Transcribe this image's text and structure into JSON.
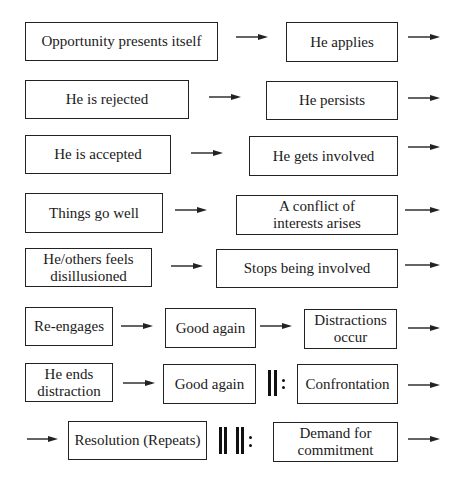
{
  "diagram": {
    "title": "",
    "nodes": [
      {
        "id": "n1",
        "label": "Opportunity presents itself",
        "x": 25,
        "y": 22,
        "w": 193,
        "h": 39
      },
      {
        "id": "n2",
        "label": "He applies",
        "x": 286,
        "y": 22,
        "w": 112,
        "h": 40
      },
      {
        "id": "n3",
        "label": "He is rejected",
        "x": 25,
        "y": 80,
        "w": 164,
        "h": 39
      },
      {
        "id": "n4",
        "label": "He persists",
        "x": 266,
        "y": 81,
        "w": 132,
        "h": 39
      },
      {
        "id": "n5",
        "label": "He is accepted",
        "x": 25,
        "y": 135,
        "w": 146,
        "h": 39
      },
      {
        "id": "n6",
        "label": "He gets involved",
        "x": 249,
        "y": 136,
        "w": 149,
        "h": 40
      },
      {
        "id": "n7",
        "label": "Things go well",
        "x": 25,
        "y": 193,
        "w": 138,
        "h": 40
      },
      {
        "id": "n8",
        "label": "A conflict of\ninterests arises",
        "x": 236,
        "y": 195,
        "w": 162,
        "h": 40
      },
      {
        "id": "n9",
        "label": "He/others feels\ndisillusioned",
        "x": 25,
        "y": 248,
        "w": 127,
        "h": 39
      },
      {
        "id": "n10",
        "label": "Stops being involved",
        "x": 216,
        "y": 249,
        "w": 182,
        "h": 39
      },
      {
        "id": "n11",
        "label": "Re-engages",
        "x": 25,
        "y": 307,
        "w": 88,
        "h": 39
      },
      {
        "id": "n12",
        "label": "Good again",
        "x": 165,
        "y": 308,
        "w": 91,
        "h": 40
      },
      {
        "id": "n13",
        "label": "Distractions\noccur",
        "x": 304,
        "y": 309,
        "w": 93,
        "h": 40
      },
      {
        "id": "n14",
        "label": "He ends\ndistraction",
        "x": 25,
        "y": 363,
        "w": 88,
        "h": 39
      },
      {
        "id": "n15",
        "label": "Good again",
        "x": 163,
        "y": 364,
        "w": 93,
        "h": 40
      },
      {
        "id": "n16",
        "label": "Confrontation",
        "x": 297,
        "y": 364,
        "w": 101,
        "h": 40
      },
      {
        "id": "n17",
        "label": "Resolution (Repeats)",
        "x": 68,
        "y": 421,
        "w": 139,
        "h": 39
      },
      {
        "id": "n18",
        "label": "Demand for\ncommitment",
        "x": 273,
        "y": 422,
        "w": 125,
        "h": 40
      }
    ],
    "arrows": [
      {
        "x": 236,
        "y": 37,
        "w": 32
      },
      {
        "x": 408,
        "y": 37,
        "w": 32
      },
      {
        "x": 209,
        "y": 97,
        "w": 32
      },
      {
        "x": 408,
        "y": 98,
        "w": 32
      },
      {
        "x": 191,
        "y": 153,
        "w": 32
      },
      {
        "x": 408,
        "y": 147,
        "w": 32
      },
      {
        "x": 175,
        "y": 210,
        "w": 32
      },
      {
        "x": 405,
        "y": 210,
        "w": 35
      },
      {
        "x": 171,
        "y": 266,
        "w": 32
      },
      {
        "x": 405,
        "y": 265,
        "w": 35
      },
      {
        "x": 121,
        "y": 326,
        "w": 32
      },
      {
        "x": 260,
        "y": 326,
        "w": 32
      },
      {
        "x": 408,
        "y": 328,
        "w": 32
      },
      {
        "x": 123,
        "y": 383,
        "w": 32
      },
      {
        "x": 408,
        "y": 385,
        "w": 32
      },
      {
        "x": 27,
        "y": 439,
        "w": 31
      },
      {
        "x": 408,
        "y": 439,
        "w": 32
      }
    ],
    "repeat_signs": [
      {
        "label": "double bar repeat",
        "bars": [
          268,
          274
        ],
        "dots_x": 282,
        "top": 370,
        "height": 26
      },
      {
        "label": "quadruple bar repeat",
        "bars": [
          219,
          224,
          236,
          241
        ],
        "dots_x": 249,
        "top": 427,
        "height": 27
      }
    ],
    "colors": {
      "stroke": "#222222",
      "text": "#1a1a1a",
      "background": "#ffffff"
    }
  }
}
